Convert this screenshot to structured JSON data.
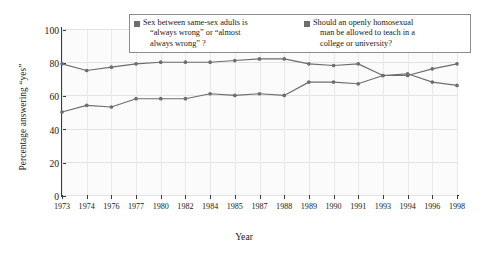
{
  "chart_data": {
    "type": "line",
    "title": "",
    "xlabel": "Year",
    "ylabel": "Percentage answering \"yes\"",
    "categories": [
      "1973",
      "1974",
      "1976",
      "1977",
      "1980",
      "1982",
      "1984",
      "1985",
      "1987",
      "1988",
      "1989",
      "1990",
      "1991",
      "1993",
      "1994",
      "1996",
      "1998"
    ],
    "ylim": [
      0,
      100
    ],
    "yticks": [
      0,
      20,
      40,
      60,
      80,
      100
    ],
    "grid": true,
    "legend_position": "top-center",
    "series": [
      {
        "name": "Sex between same-sex adults is \"always wrong\" or \"almost always wrong\"?",
        "color": "#6e6e6e",
        "values": [
          79,
          75,
          77,
          79,
          80,
          80,
          80,
          81,
          82,
          82,
          79,
          78,
          79,
          72,
          73,
          68,
          66
        ]
      },
      {
        "name": "Should an openly homosexual man be allowed to teach in a college or university?",
        "color": "#6e6e6e",
        "values": [
          50,
          54,
          53,
          58,
          58,
          58,
          61,
          60,
          61,
          60,
          68,
          68,
          67,
          72,
          72,
          76,
          79
        ]
      }
    ]
  },
  "legend": {
    "entries": [
      {
        "swatch_color": "#6e6e6e",
        "line1": "Sex between same-sex adults is",
        "line2": "“always wrong”  or “almost",
        "line3": "always wrong” ?"
      },
      {
        "swatch_color": "#6e6e6e",
        "line1": "Should an openly homosexual",
        "line2": "man be allowed to teach in a",
        "line3": "college or university?"
      }
    ]
  },
  "axes": {
    "y_title": "Percentage answering “yes”",
    "x_title": "Year",
    "y_tick_labels": [
      "0",
      "20",
      "40",
      "60",
      "80",
      "100"
    ],
    "x_tick_labels": [
      "1973",
      "1974",
      "1976",
      "1977",
      "1980",
      "1982",
      "1984",
      "1985",
      "1987",
      "1988",
      "1989",
      "1990",
      "1991",
      "1993",
      "1994",
      "1996",
      "1998"
    ]
  }
}
